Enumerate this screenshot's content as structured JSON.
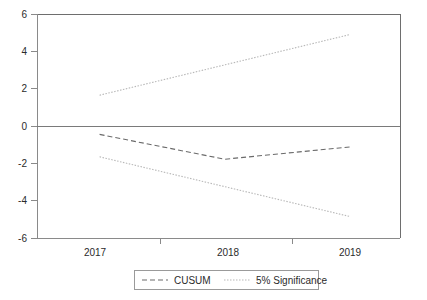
{
  "chart_data": {
    "type": "line",
    "title": "",
    "subtitle": "",
    "xlabel": "",
    "ylabel": "",
    "xlim": [
      2016.5,
      2019.4
    ],
    "ylim": [
      -6,
      6
    ],
    "grid": false,
    "legend_position": "bottom-center",
    "x_tick_labels": [
      "2017",
      "2018",
      "2019"
    ],
    "x_tick_values": [
      2017,
      2018,
      2019
    ],
    "y_tick_labels": [
      "6",
      "4",
      "2",
      "0",
      "-2",
      "-4",
      "-6"
    ],
    "y_tick_values": [
      6,
      4,
      2,
      0,
      -2,
      -4,
      -6
    ],
    "zero_line": 0,
    "series": [
      {
        "name": "CUSUM",
        "style": "dashed",
        "color": "#6a6a6a",
        "x": [
          2017.0,
          2018.0,
          2019.0
        ],
        "values": [
          -0.45,
          -1.78,
          -1.12
        ]
      },
      {
        "name": "5% Significance",
        "style": "dotted",
        "color": "#b8b8b8",
        "x": [
          2017.0,
          2019.0
        ],
        "values": [
          1.65,
          4.9
        ],
        "band": "upper"
      },
      {
        "name": "5% Significance",
        "style": "dotted",
        "color": "#b8b8b8",
        "x": [
          2017.0,
          2019.0
        ],
        "values": [
          -1.65,
          -4.85
        ],
        "band": "lower"
      }
    ]
  },
  "axes": {
    "y_ticks": [
      {
        "label": "6"
      },
      {
        "label": "4"
      },
      {
        "label": "2"
      },
      {
        "label": "0"
      },
      {
        "label": "-2"
      },
      {
        "label": "-4"
      },
      {
        "label": "-6"
      }
    ],
    "x_ticks": [
      {
        "label": "2017"
      },
      {
        "label": "2018"
      },
      {
        "label": "2019"
      }
    ]
  },
  "legend": {
    "items": [
      {
        "label": "CUSUM",
        "style": "dashed"
      },
      {
        "label": "5% Significance",
        "style": "dotted"
      }
    ]
  },
  "colors": {
    "background": "#ffffff",
    "axis": "#8a8a8a",
    "text": "#2b2b2b",
    "cusum": "#6a6a6a",
    "significance": "#b8b8b8"
  }
}
